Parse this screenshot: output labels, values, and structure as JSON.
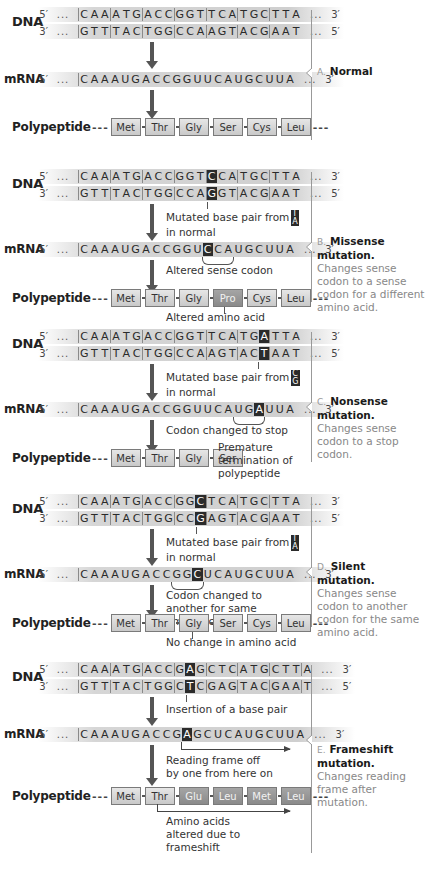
{
  "labels": {
    "dna": "DNA",
    "mrna": "mRNA",
    "polypeptide": "Polypeptide",
    "p5": "5′",
    "p3": "3′",
    "dots": "...",
    "dash": "---"
  },
  "panels": [
    {
      "id": "normal",
      "dna_top": "CAAATGACCGGTTCATGCTTA",
      "dna_bottom": "GTTTACTGGCCAAGTACGAAT",
      "mrna": "CAAAUGACCGGUUCAUGCUUA",
      "mutated_index": null,
      "polypeptide": [
        "Met",
        "Thr",
        "Gly",
        "Ser",
        "Cys",
        "Leu"
      ],
      "altered_aa": [],
      "caption": {
        "letter": "A.",
        "title": "Normal",
        "body": ""
      }
    },
    {
      "id": "missense",
      "dna_top": "CAAATGACCGGTCCATGCTTA",
      "dna_bottom": "GTTTACTGGCCAGGTACGAAT",
      "mrna": "CAAAUGACCGGUCCAUGCUUA",
      "mutated_index": 12,
      "dna_note": "Mutated base pair from",
      "dna_note2": "in normal",
      "original_pair": [
        "T",
        "A"
      ],
      "mrna_note": "Altered sense codon",
      "polypeptide": [
        "Met",
        "Thr",
        "Gly",
        "Pro",
        "Cys",
        "Leu"
      ],
      "altered_aa": [
        3
      ],
      "poly_note": "Altered amino acid",
      "caption": {
        "letter": "B.",
        "title": "Missense mutation.",
        "body": "Changes sense codon to a sense codon for a different amino acid."
      }
    },
    {
      "id": "nonsense",
      "dna_top": "CAAATGACCGGTTCATGATTA",
      "dna_bottom": "GTTTACTGGCCAAGTACTAAT",
      "mrna": "CAAAUGACCGGUUCAUGAUUA",
      "mutated_index": 17,
      "dna_note": "Mutated base pair from",
      "dna_note2": "in normal",
      "original_pair": [
        "C",
        "G"
      ],
      "mrna_note": "Codon changed to stop",
      "polypeptide": [
        "Met",
        "Thr",
        "Gly",
        "Ser"
      ],
      "altered_aa": [],
      "poly_note": "Premature termination of polypeptide",
      "caption": {
        "letter": "C.",
        "title": "Nonsense mutation.",
        "body": "Changes sense codon to a stop codon."
      }
    },
    {
      "id": "silent",
      "dna_top": "CAAATGACCGGCTCATGCTTA",
      "dna_bottom": "GTTTACTGGCCGAGTACGAAT",
      "mrna": "CAAAUGACCGGCUCAUGCUUA",
      "mutated_index": 11,
      "dna_note": "Mutated base pair from",
      "dna_note2": "in normal",
      "original_pair": [
        "T",
        "A"
      ],
      "mrna_note": "Codon changed to another for same amino acid",
      "polypeptide": [
        "Met",
        "Thr",
        "Gly",
        "Ser",
        "Cys",
        "Leu"
      ],
      "altered_aa": [],
      "poly_note": "No change in amino acid",
      "caption": {
        "letter": "D.",
        "title": "Silent mutation.",
        "body": "Changes sense codon to another codon for the same amino acid."
      }
    },
    {
      "id": "frameshift",
      "dna_top": "CAAATGACCGAGCTCATGCTTA",
      "dna_bottom": "GTTTACTGGCTCGAGTACGAAT",
      "mrna": "CAAAUGACCGAGCUCAUGCUUA",
      "mutated_index": 10,
      "dna_note": "Insertion of a base pair",
      "mrna_note": "Reading frame off by one from here on",
      "polypeptide": [
        "Met",
        "Thr",
        "Glu",
        "Leu",
        "Met",
        "Leu"
      ],
      "altered_aa": [
        2,
        3,
        4,
        5
      ],
      "poly_note": "Amino acids altered due to frameshift",
      "caption": {
        "letter": "E.",
        "title": "Frameshift mutation.",
        "body": "Changes reading frame after mutation."
      }
    }
  ]
}
